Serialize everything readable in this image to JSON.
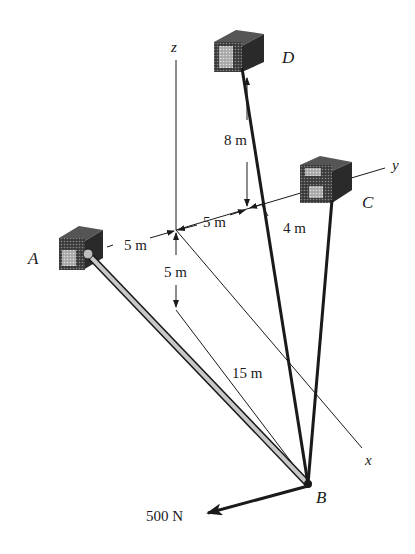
{
  "figure": {
    "axes": {
      "x_label": "x",
      "y_label": "y",
      "z_label": "z"
    },
    "points": {
      "A": "A",
      "B": "B",
      "C": "C",
      "D": "D"
    },
    "dimensions": {
      "a_to_origin": "5 m",
      "origin_to_y_mark": "5 m",
      "y_mark_to_c": "4 m",
      "d_height": "8 m",
      "z_drop": "5 m",
      "x_length": "15 m"
    },
    "load": {
      "label": "500 N"
    },
    "colors": {
      "ink": "#1a1a1a",
      "boom_fill": "#bdbdbd",
      "block_dark": "#2a2a2a",
      "block_light": "#9a9a9a"
    }
  }
}
